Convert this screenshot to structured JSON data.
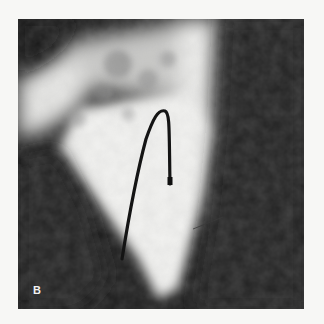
{
  "figure": {
    "panel_label": "B",
    "colors": {
      "background": "#f7f7f5",
      "frame_dark": "#1a1a1a",
      "opacified": "#f2f2f0",
      "catheter": "#141414"
    }
  }
}
